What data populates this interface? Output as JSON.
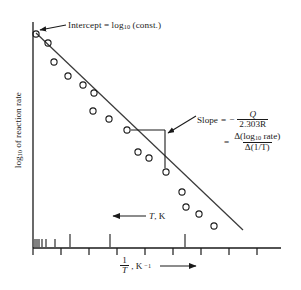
{
  "figure": {
    "type": "arrhenius-plot",
    "background": "#ffffff",
    "ink": "#1a1a1a"
  },
  "annotations": {
    "intercept": {
      "prefix": "Intercept = log",
      "sub": "10",
      "suffix": " (const.)"
    },
    "temperature_arrow": {
      "symbol": "T",
      "unit": ", K",
      "direction": "left"
    },
    "slope": {
      "label": "Slope",
      "equals": "=",
      "minus": "−",
      "numerator1": "Q",
      "denominator1": "2.303R",
      "equals2": "=",
      "numerator2_prefix": "Δ(log",
      "numerator2_sub": "10",
      "numerator2_suffix": " rate)",
      "denominator2": "Δ(1/T)"
    }
  },
  "axes": {
    "ylabel_prefix": "log",
    "ylabel_sub": "10",
    "ylabel_suffix": " of reaction rate",
    "xlabel_num": "1",
    "xlabel_den": "T",
    "xlabel_unit": ", K",
    "xlabel_unit_sup": "−1",
    "x_axis_y": 248,
    "y_axis_x": 33,
    "x_axis_x_end": 281,
    "y_axis_y_top": 22,
    "lower_ticks_x": [
      33,
      61,
      89,
      117,
      145,
      173,
      201,
      229,
      257
    ],
    "lower_tick_len": 7,
    "upper_ticks_x": [
      35,
      37,
      39,
      42,
      46,
      55,
      70,
      110,
      185
    ],
    "upper_tick_len_short": 8,
    "upper_tick_len_long": 13
  },
  "chart_data": {
    "type": "scatter",
    "title": "",
    "xlabel": "1/T, K^-1",
    "ylabel": "log10 of reaction rate",
    "grid": false,
    "legend": null,
    "axis_ticks_labeled": false,
    "note": "Arrhenius plot: log10(rate) decreases linearly with 1/T; T increases to the left.",
    "xlim": [
      33,
      281
    ],
    "ylim_pixels": [
      22,
      248
    ],
    "fit_line": {
      "x1": 36,
      "y1": 33,
      "x2": 243,
      "y2": 230,
      "description": "least-squares straight line through the points"
    },
    "intercept_marker": {
      "x": 36,
      "y": 33
    },
    "slope_triangle": {
      "apex_x": 131,
      "apex_y": 130,
      "corner_x": 165,
      "corner_y": 130,
      "base_x": 165,
      "base_y": 168
    },
    "points": [
      {
        "x": 36,
        "y": 34
      },
      {
        "x": 48,
        "y": 43
      },
      {
        "x": 54,
        "y": 62
      },
      {
        "x": 68,
        "y": 76
      },
      {
        "x": 83,
        "y": 85
      },
      {
        "x": 94,
        "y": 93
      },
      {
        "x": 93,
        "y": 111
      },
      {
        "x": 109,
        "y": 119
      },
      {
        "x": 127,
        "y": 130
      },
      {
        "x": 138,
        "y": 152
      },
      {
        "x": 149,
        "y": 158
      },
      {
        "x": 166,
        "y": 172
      },
      {
        "x": 182,
        "y": 192
      },
      {
        "x": 186,
        "y": 207
      },
      {
        "x": 199,
        "y": 214
      },
      {
        "x": 214,
        "y": 226
      }
    ],
    "point_marker": {
      "shape": "open-circle",
      "radius": 3.1,
      "stroke": "#1a1a1a",
      "fill": "none"
    }
  }
}
